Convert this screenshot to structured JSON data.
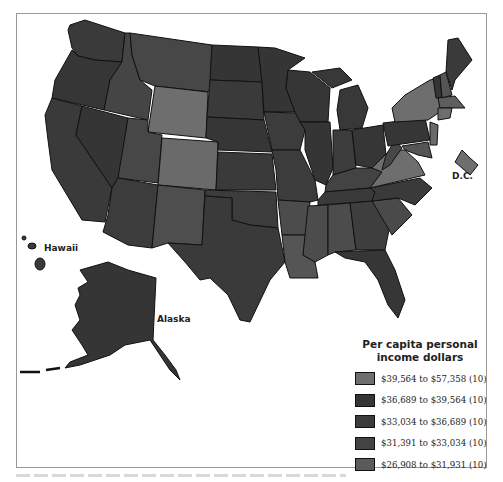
{
  "map": {
    "labels": {
      "hawaii": "Hawaii",
      "alaska": "Alaska",
      "dc": "D.C."
    }
  },
  "legend": {
    "title_line1": "Per capita personal",
    "title_line2": "income dollars",
    "items": [
      {
        "label": "$39,564 to $57,358 (10)",
        "color": "#6e6e6e"
      },
      {
        "label": "$36,689 to $39,564 (10)",
        "color": "#353535"
      },
      {
        "label": "$33,034 to $36,689 (10)",
        "color": "#3c3c3c"
      },
      {
        "label": "$31,391 to $33,034 (10)",
        "color": "#434343"
      },
      {
        "label": "$26,908 to $31,931 (10)",
        "color": "#5a5a5a"
      }
    ]
  },
  "colors": {
    "border": "#111111",
    "background": "#ffffff",
    "class1": "#6e6e6e",
    "class2": "#353535",
    "class3": "#3c3c3c",
    "class4": "#434343",
    "class5": "#5a5a5a"
  }
}
